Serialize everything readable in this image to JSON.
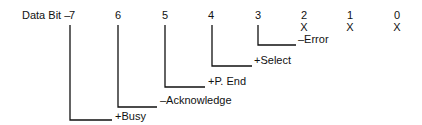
{
  "diagram": {
    "row_label": "Data Bit –",
    "bits": [
      "7",
      "6",
      "5",
      "4",
      "3",
      "2",
      "1",
      "0"
    ],
    "unused_marks": [
      "X",
      "X",
      "X"
    ],
    "signals": [
      {
        "bit": "7",
        "label": "+Busy"
      },
      {
        "bit": "6",
        "label": "–Acknowledge"
      },
      {
        "bit": "5",
        "label": "+P. End"
      },
      {
        "bit": "4",
        "label": "+Select"
      },
      {
        "bit": "3",
        "label": "–Error"
      }
    ],
    "line_color": "#111111"
  }
}
